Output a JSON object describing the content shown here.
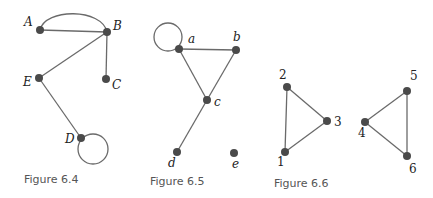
{
  "figures": [
    {
      "caption": "Figure 6.4",
      "nodes": [
        {
          "id": "A",
          "label": "A"
        },
        {
          "id": "B",
          "label": "B"
        },
        {
          "id": "C",
          "label": "C"
        },
        {
          "id": "D",
          "label": "D"
        },
        {
          "id": "E",
          "label": "E"
        }
      ],
      "edges": [
        [
          "A",
          "B"
        ],
        [
          "A",
          "B"
        ],
        [
          "B",
          "C"
        ],
        [
          "B",
          "E"
        ],
        [
          "E",
          "D"
        ],
        [
          "D",
          "D"
        ]
      ]
    },
    {
      "caption": "Figure 6.5",
      "nodes": [
        {
          "id": "a",
          "label": "a"
        },
        {
          "id": "b",
          "label": "b"
        },
        {
          "id": "c",
          "label": "c"
        },
        {
          "id": "d",
          "label": "d"
        },
        {
          "id": "e",
          "label": "e"
        }
      ],
      "edges": [
        [
          "a",
          "a"
        ],
        [
          "a",
          "b"
        ],
        [
          "a",
          "c"
        ],
        [
          "b",
          "c"
        ],
        [
          "c",
          "d"
        ]
      ]
    },
    {
      "caption": "Figure 6.6",
      "nodes": [
        {
          "id": "1",
          "label": "1"
        },
        {
          "id": "2",
          "label": "2"
        },
        {
          "id": "3",
          "label": "3"
        },
        {
          "id": "4",
          "label": "4"
        },
        {
          "id": "5",
          "label": "5"
        },
        {
          "id": "6",
          "label": "6"
        }
      ],
      "edges": [
        [
          "1",
          "2"
        ],
        [
          "2",
          "3"
        ],
        [
          "1",
          "3"
        ],
        [
          "4",
          "5"
        ],
        [
          "5",
          "6"
        ],
        [
          "4",
          "6"
        ]
      ]
    }
  ],
  "colors": {
    "node": "#4a4a4a",
    "edge": "#6a6a6a",
    "caption": "#555555"
  }
}
